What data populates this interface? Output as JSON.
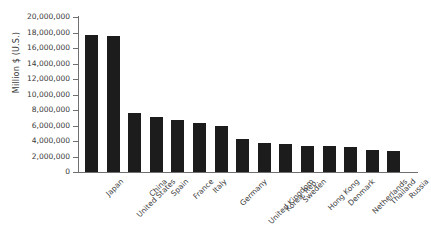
{
  "chart_data": {
    "type": "bar",
    "title": "",
    "xlabel": "",
    "ylabel": "Million $ (U.S.)",
    "ylim": [
      0,
      20000000
    ],
    "ytick_step": 2000000,
    "grid": false,
    "legend": null,
    "bar_color": "#1c1c1c",
    "axis_color": "#6f6f6f",
    "ytick_labels": [
      "20,000,000",
      "18,000,000",
      "16,000,000",
      "14,000,000",
      "12,000,000",
      "10,000,000",
      "8,000,000",
      "6,000,000",
      "4,000,000",
      "2,000,000",
      "0"
    ],
    "ytick_values": [
      20000000,
      18000000,
      16000000,
      14000000,
      12000000,
      10000000,
      8000000,
      6000000,
      4000000,
      2000000,
      0
    ],
    "categories": [
      "Japan",
      "United States",
      "China",
      "Spain",
      "France",
      "Italy",
      "Germany",
      "United Kingdom",
      "Korea, Rep.",
      "Sweden",
      "Hong Kong",
      "Denmark",
      "Netherlands",
      "Thailand",
      "Russia"
    ],
    "values": [
      17700000,
      17600000,
      7650000,
      7100000,
      6750000,
      6350000,
      5950000,
      4200000,
      3800000,
      3600000,
      3400000,
      3300000,
      3250000,
      2900000,
      2700000
    ]
  }
}
